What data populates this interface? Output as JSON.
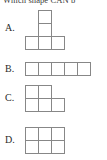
{
  "question": {
    "text": "Which shape CAN b"
  },
  "options": [
    {
      "id": "a",
      "label": "A.",
      "shape_name": "t-tetromino-plus",
      "cell_count": 5,
      "cells": [
        {
          "col": 1,
          "row": 0
        },
        {
          "col": 1,
          "row": 1
        },
        {
          "col": 0,
          "row": 2
        },
        {
          "col": 1,
          "row": 2
        },
        {
          "col": 2,
          "row": 2
        }
      ]
    },
    {
      "id": "b",
      "label": "B.",
      "shape_name": "horizontal-strip",
      "cell_count": 5,
      "cells": [
        {
          "col": 0,
          "row": 0
        },
        {
          "col": 1,
          "row": 0
        },
        {
          "col": 2,
          "row": 0
        },
        {
          "col": 3,
          "row": 0
        },
        {
          "col": 4,
          "row": 0
        }
      ]
    },
    {
      "id": "c",
      "label": "C.",
      "shape_name": "p-pentomino",
      "cell_count": 5,
      "cells": [
        {
          "col": 0,
          "row": 0
        },
        {
          "col": 1,
          "row": 0
        },
        {
          "col": 0,
          "row": 1
        },
        {
          "col": 1,
          "row": 1
        },
        {
          "col": 2,
          "row": 1
        }
      ]
    },
    {
      "id": "d",
      "label": "D.",
      "shape_name": "rectangle-3x2",
      "cell_count": 6,
      "cells": [
        {
          "col": 0,
          "row": 0
        },
        {
          "col": 1,
          "row": 0
        },
        {
          "col": 2,
          "row": 0
        },
        {
          "col": 0,
          "row": 1
        },
        {
          "col": 1,
          "row": 1
        },
        {
          "col": 2,
          "row": 1
        }
      ]
    }
  ],
  "colors": {
    "background": "#ffffff",
    "grid_line": "#878787",
    "text": "#2b2b2b"
  }
}
